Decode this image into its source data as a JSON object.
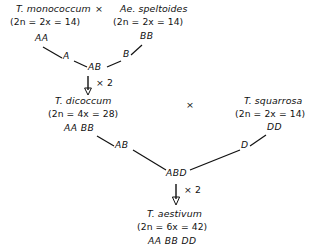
{
  "diagram": {
    "line_color": "#111111",
    "background": "#ffffff",
    "cross_symbol_1": "×",
    "cross_symbol_2": "×",
    "parents": [
      {
        "id": "t-monococcum",
        "species": "T. monococcum",
        "ploidy": "(2n = 2x = 14)",
        "genome": "AA"
      },
      {
        "id": "ae-speltoides",
        "species": "Ae. speltoides",
        "ploidy": "(2n = 2x = 14)",
        "genome": "BB"
      }
    ],
    "gametes_first": [
      {
        "id": "gamete-a",
        "label": "A"
      },
      {
        "id": "gamete-b",
        "label": "B"
      }
    ],
    "hybrid_first": {
      "id": "hybrid-ab",
      "label": "AB"
    },
    "doubling_first": {
      "id": "doubling-1",
      "label": "× 2"
    },
    "tetraploid": {
      "id": "t-dicoccum",
      "species": "T. dicoccum",
      "ploidy": "(2n = 4x = 28)",
      "genome": "AA BB"
    },
    "third_parent": {
      "id": "t-squarrosa",
      "species": "T. squarrosa",
      "ploidy": "(2n = 2x = 14)",
      "genome": "DD"
    },
    "gametes_second": [
      {
        "id": "gamete-ab",
        "label": "AB"
      },
      {
        "id": "gamete-d",
        "label": "D"
      }
    ],
    "hybrid_second": {
      "id": "hybrid-abd",
      "label": "ABD"
    },
    "doubling_second": {
      "id": "doubling-2",
      "label": "× 2"
    },
    "hexaploid": {
      "id": "t-aestivum",
      "species": "T. aestivum",
      "ploidy": "(2n = 6x = 42)",
      "genome": "AA  BB  DD"
    }
  }
}
